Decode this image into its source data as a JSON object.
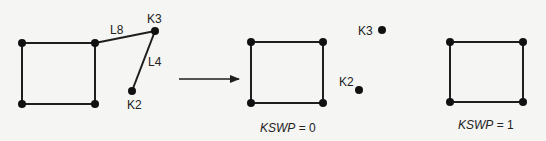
{
  "diagram": {
    "panels": [
      {
        "id": "before",
        "square": [
          [
            22,
            43
          ],
          [
            95,
            43
          ],
          [
            95,
            104
          ],
          [
            22,
            104
          ]
        ],
        "extra_nodes": [
          {
            "label": "K3",
            "x": 155,
            "y": 31
          },
          {
            "label": "K2",
            "x": 132,
            "y": 91
          }
        ],
        "lines": [
          {
            "label": "L8",
            "from": [
              95,
              43
            ],
            "to": [
              155,
              31
            ]
          },
          {
            "label": "L4",
            "from": [
              155,
              31
            ],
            "to": [
              132,
              91
            ]
          }
        ]
      },
      {
        "id": "kswp0",
        "square": [
          [
            251,
            42
          ],
          [
            323,
            42
          ],
          [
            323,
            103
          ],
          [
            251,
            103
          ]
        ],
        "extra_nodes": [
          {
            "label": "K3",
            "x": 382,
            "y": 30
          },
          {
            "label": "K2",
            "x": 359,
            "y": 90
          }
        ],
        "caption": {
          "var": "KSWP",
          "rest": " = 0"
        }
      },
      {
        "id": "kswp1",
        "square": [
          [
            450,
            42
          ],
          [
            523,
            42
          ],
          [
            523,
            102
          ],
          [
            450,
            102
          ]
        ],
        "caption": {
          "var": "KSWP",
          "rest": " = 1"
        }
      }
    ],
    "labels": {
      "l8": "L8",
      "l4": "L4",
      "k3": "K3",
      "k2": "K2",
      "kswp0_var": "KSWP",
      "kswp0_rest": " = 0",
      "kswp1_var": "KSWP",
      "kswp1_rest": " = 1"
    },
    "colors": {
      "line": "#1e1e1e",
      "node": "#111111",
      "background": "#f5f5f3"
    }
  }
}
